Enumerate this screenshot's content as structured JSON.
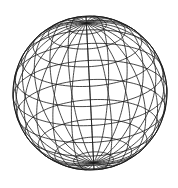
{
  "figure": {
    "background": "#ffffff",
    "stroke_color": "#1a1a1a",
    "center": [
      90,
      93
    ],
    "radius": 77,
    "tilt_deg": 25,
    "roll_deg": 3,
    "latitude_lines": 11,
    "longitude_lines": 24
  }
}
